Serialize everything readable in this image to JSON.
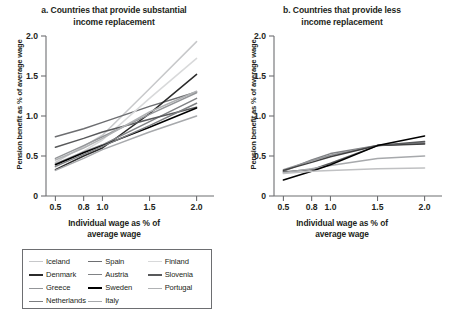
{
  "figure": {
    "axis_color": "#6d6e71",
    "text_color": "#231f20"
  },
  "panels": [
    {
      "id": "panel-a",
      "title_line1": "a. Countries that provide substantial",
      "title_line2": "income replacement",
      "ylabel": "Pension benefit as % of average wage",
      "xlabel_line1": "Individual wage as % of",
      "xlabel_line2": "average wage",
      "yticks": [
        "2.0",
        "1.5",
        "1.0",
        "0.5",
        "0"
      ],
      "xticks": [
        "0.5",
        "0.8",
        "1.0",
        "1.5",
        "2.0"
      ]
    },
    {
      "id": "panel-b",
      "title_line1": "b. Countries that provide less",
      "title_line2": "income replacement",
      "ylabel": "Pension benefit as % of average wage",
      "xlabel_line1": "Individual wage as % of",
      "xlabel_line2": "average wage",
      "yticks": [
        "2.0",
        "1.5",
        "1.0",
        "0.5",
        "0"
      ],
      "xticks": [
        "0.5",
        "0.8",
        "1.0",
        "1.5",
        "2.0"
      ]
    }
  ],
  "legends": [
    {
      "id": "legend-a",
      "items": [
        {
          "label": "Iceland",
          "color": "#c7c8ca",
          "width": 1.6
        },
        {
          "label": "Spain",
          "color": "#6d6e71",
          "width": 1.8
        },
        {
          "label": "Finland",
          "color": "#d8d9da",
          "width": 1.6
        },
        {
          "label": "Denmark",
          "color": "#2b2b2b",
          "width": 2.2
        },
        {
          "label": "Austria",
          "color": "#808285",
          "width": 1.8
        },
        {
          "label": "Slovenia",
          "color": "#58595b",
          "width": 2.0
        },
        {
          "label": "Greece",
          "color": "#939598",
          "width": 1.8
        },
        {
          "label": "Sweden",
          "color": "#000000",
          "width": 2.4
        },
        {
          "label": "Portugal",
          "color": "#b0b2b4",
          "width": 1.6
        },
        {
          "label": "Netherlands",
          "color": "#7c7e81",
          "width": 1.8
        },
        {
          "label": "Italy",
          "color": "#a7a9ac",
          "width": 1.8
        }
      ]
    },
    {
      "id": "legend-b",
      "items": [
        {
          "label": "Switzerland",
          "color": "#808285",
          "width": 1.8
        },
        {
          "label": "Ireland",
          "color": "#939598",
          "width": 1.8
        },
        {
          "label": "Norway",
          "color": "#404041",
          "width": 2.0
        },
        {
          "label": "United Kingdom",
          "color": "#58595b",
          "width": 2.2
        },
        {
          "label": "France",
          "color": "#a7a9ac",
          "width": 1.8
        },
        {
          "label": "Germany",
          "color": "#000000",
          "width": 2.4
        },
        {
          "label": "Belgium",
          "color": "#c0c1c3",
          "width": 1.8
        }
      ]
    }
  ],
  "chart_data": [
    {
      "type": "line",
      "panel": "a",
      "title": "a. Countries that provide substantial income replacement",
      "xlabel": "Individual wage as % of average wage",
      "ylabel": "Pension benefit as % of average wage",
      "x": [
        0.5,
        0.8,
        1.0,
        1.5,
        2.0
      ],
      "xlim": [
        0.4,
        2.1
      ],
      "ylim": [
        0.0,
        2.0
      ],
      "xticks": [
        0.5,
        0.8,
        1.0,
        1.5,
        2.0
      ],
      "yticks": [
        0,
        0.5,
        1.0,
        1.5,
        2.0
      ],
      "grid": false,
      "legend_position": "below",
      "series": [
        {
          "name": "Iceland",
          "color": "#c7c8ca",
          "values": [
            0.42,
            0.62,
            0.76,
            1.34,
            1.93
          ]
        },
        {
          "name": "Spain",
          "color": "#6d6e71",
          "values": [
            0.74,
            0.84,
            0.92,
            1.12,
            1.3
          ]
        },
        {
          "name": "Finland",
          "color": "#d8d9da",
          "values": [
            0.36,
            0.56,
            0.7,
            1.22,
            1.72
          ]
        },
        {
          "name": "Denmark",
          "color": "#2b2b2b",
          "values": [
            0.33,
            0.5,
            0.6,
            1.03,
            1.52
          ]
        },
        {
          "name": "Austria",
          "color": "#808285",
          "values": [
            0.4,
            0.55,
            0.64,
            0.93,
            1.22
          ]
        },
        {
          "name": "Slovenia",
          "color": "#58595b",
          "values": [
            0.61,
            0.72,
            0.8,
            0.96,
            1.11
          ]
        },
        {
          "name": "Greece",
          "color": "#939598",
          "values": [
            0.47,
            0.63,
            0.74,
            1.02,
            1.29
          ]
        },
        {
          "name": "Sweden",
          "color": "#000000",
          "values": [
            0.39,
            0.54,
            0.63,
            0.86,
            1.1
          ]
        },
        {
          "name": "Portugal",
          "color": "#b0b2b4",
          "values": [
            0.45,
            0.6,
            0.72,
            1.05,
            1.31
          ]
        },
        {
          "name": "Netherlands",
          "color": "#7c7e81",
          "values": [
            0.37,
            0.52,
            0.62,
            0.88,
            1.16
          ]
        },
        {
          "name": "Italy",
          "color": "#a7a9ac",
          "values": [
            0.32,
            0.47,
            0.58,
            0.8,
            1.0
          ]
        }
      ]
    },
    {
      "type": "line",
      "panel": "b",
      "title": "b. Countries that provide less income replacement",
      "xlabel": "Individual wage as % of average wage",
      "ylabel": "Pension benefit as % of average wage",
      "x": [
        0.5,
        0.8,
        1.0,
        1.5,
        2.0
      ],
      "xlim": [
        0.4,
        2.1
      ],
      "ylim": [
        0.0,
        2.0
      ],
      "xticks": [
        0.5,
        0.8,
        1.0,
        1.5,
        2.0
      ],
      "yticks": [
        0,
        0.5,
        1.0,
        1.5,
        2.0
      ],
      "grid": false,
      "legend_position": "below",
      "series": [
        {
          "name": "Switzerland",
          "color": "#808285",
          "values": [
            0.31,
            0.45,
            0.53,
            0.63,
            0.66
          ]
        },
        {
          "name": "Ireland",
          "color": "#939598",
          "values": [
            0.33,
            0.44,
            0.51,
            0.63,
            0.67
          ]
        },
        {
          "name": "Norway",
          "color": "#404041",
          "values": [
            0.32,
            0.42,
            0.49,
            0.63,
            0.65
          ]
        },
        {
          "name": "United Kingdom",
          "color": "#58595b",
          "values": [
            0.3,
            0.33,
            0.41,
            0.63,
            0.68
          ]
        },
        {
          "name": "France",
          "color": "#a7a9ac",
          "values": [
            0.29,
            0.34,
            0.38,
            0.47,
            0.5
          ]
        },
        {
          "name": "Germany",
          "color": "#000000",
          "values": [
            0.2,
            0.31,
            0.39,
            0.63,
            0.75
          ]
        },
        {
          "name": "Belgium",
          "color": "#c0c1c3",
          "values": [
            0.28,
            0.31,
            0.32,
            0.34,
            0.35
          ]
        }
      ]
    }
  ]
}
